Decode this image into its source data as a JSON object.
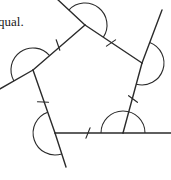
{
  "page": {
    "width": 171,
    "height": 180,
    "background_color": "#ffffff"
  },
  "caption": {
    "text": "qual.",
    "note": "clipped text fragment at left edge of figure"
  },
  "figure": {
    "name": "pentagon-exterior-angles-diagram",
    "shape": "pentagon",
    "stroke_color": "#2b2b2b",
    "stroke_width": 1.4,
    "vertices": [
      {
        "id": "A",
        "label": "top",
        "x": 85,
        "y": 25
      },
      {
        "id": "B",
        "label": "upper-right",
        "x": 142,
        "y": 63
      },
      {
        "id": "C",
        "label": "lower-right",
        "x": 123,
        "y": 133
      },
      {
        "id": "D",
        "label": "lower-left",
        "x": 55,
        "y": 133
      },
      {
        "id": "E",
        "label": "left",
        "x": 33,
        "y": 70
      }
    ],
    "sides": [
      {
        "id": "AB",
        "from": "A",
        "to": "B",
        "tick_x": 111,
        "tick_y": 43
      },
      {
        "id": "BC",
        "from": "B",
        "to": "C",
        "tick_x": 133,
        "tick_y": 99
      },
      {
        "id": "CD",
        "from": "C",
        "to": "D",
        "tick_x": 88,
        "tick_y": 133
      },
      {
        "id": "DE",
        "from": "D",
        "to": "E",
        "tick_x": 43,
        "tick_y": 102
      },
      {
        "id": "EA",
        "from": "E",
        "to": "A",
        "tick_x": 58,
        "tick_y": 45
      }
    ],
    "extensions": [
      {
        "id": "ext-at-A",
        "at_vertex": "A",
        "from": "B",
        "end_x": 56,
        "end_y": -2
      },
      {
        "id": "ext-at-B",
        "at_vertex": "B",
        "from": "C",
        "end_x": 162,
        "end_y": 10
      },
      {
        "id": "ext-at-C",
        "at_vertex": "C",
        "from": "D",
        "end_x": 171,
        "end_y": 133
      },
      {
        "id": "ext-at-D",
        "at_vertex": "D",
        "from": "E",
        "end_x": 66,
        "end_y": 167
      },
      {
        "id": "ext-at-E",
        "at_vertex": "E",
        "from": "A",
        "end_x": -2,
        "end_y": 90
      }
    ],
    "exterior_angle_arcs": [
      {
        "id": "arc-A",
        "at_vertex": "A",
        "radius": 22
      },
      {
        "id": "arc-B",
        "at_vertex": "B",
        "radius": 22
      },
      {
        "id": "arc-C",
        "at_vertex": "C",
        "radius": 22
      },
      {
        "id": "arc-D",
        "at_vertex": "D",
        "radius": 22
      },
      {
        "id": "arc-E",
        "at_vertex": "E",
        "radius": 22
      }
    ],
    "tick_marks_count": 5,
    "tick_length": 11
  }
}
